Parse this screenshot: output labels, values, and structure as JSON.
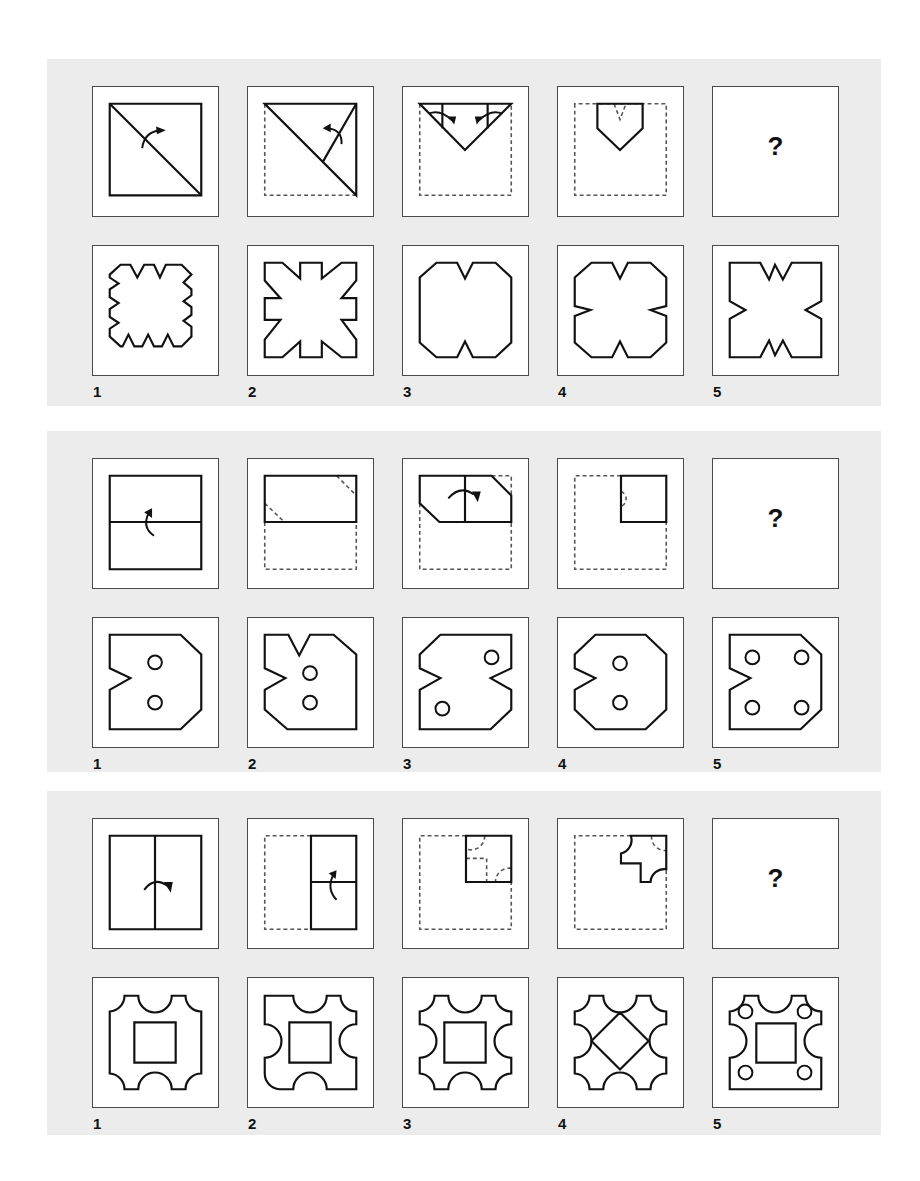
{
  "question_mark": "?",
  "colors": {
    "panel_bg": "#ececec",
    "stroke": "#111111",
    "dash": "#555555",
    "border": "#4a4a4a"
  },
  "puzzles": [
    {
      "top": 59,
      "height": 347,
      "steps": [
        {
          "solid": [
            "M17 17 H110 V110 H17 Z",
            "M17 17 L110 110"
          ],
          "dashed": [],
          "arrows": [
            "M50 62 Q52 46 68 44"
          ],
          "arrowheads": [
            [
              74,
              44,
              64,
              40,
              65,
              48
            ]
          ]
        },
        {
          "solid": [
            "M17 17 H110 V110 Z",
            "M76 76 L110 17 M17 17"
          ],
          "dashed": [
            "M17 17 V110 H110"
          ],
          "arrows": [
            "M95 58 Q96 44 82 42"
          ],
          "arrowheads": [
            [
              76,
              42,
              84,
              37,
              84,
              46
            ]
          ]
        },
        {
          "solid": [
            "M17 17 H110 L63 64 Z",
            "M40 17 V42",
            "M86 17 V42"
          ],
          "dashed": [
            "M17 17 V110 H110 V17"
          ],
          "arrows": [
            "M26 27 Q38 22 50 34",
            "M101 27 Q89 22 77 34"
          ],
          "arrowheads": [
            [
              52,
              38,
              46,
              30,
              54,
              30
            ],
            [
              75,
              38,
              73,
              30,
              81,
              30
            ]
          ]
        },
        {
          "solid": [
            "M40 17 H86 V42 L63 64 L40 42 Z"
          ],
          "dashed": [
            "M17 17 V110 H110 V17 Z",
            "M57 17 L63 33 L69 17"
          ],
          "arrows": [],
          "arrowheads": []
        },
        {
          "question": true
        }
      ],
      "options": [
        {
          "label": "1",
          "solid": [
            "M28 19 L38 19 L45 32 L52 19 L62 19 L68 32 L74 19 L82 19 L90 19 L100 29 L92 37 L100 44 L100 50 L92 56 L100 62 L100 70 L92 76 L100 82 L100 92 L90 102 L82 102 L76 90 L70 102 L62 102 L56 90 L50 102 L42 102 L36 90 L30 102 L28 102 L17 92 L17 84 L26 78 L17 72 L17 64 L26 58 L17 52 L17 44 L26 38 L17 32 L17 29 Z"
          ]
        },
        {
          "label": "2",
          "solid": [
            "M17 17 L35 17 L53 33 L53 17 L75 17 L75 33 L95 17 L110 17 L110 35 L95 53 L110 53 L110 75 L95 75 L110 95 L110 113 L95 113 L75 97 L75 113 L53 113 L53 97 L35 113 L17 113 L17 95 L33 75 L17 75 L17 53 L33 53 L17 35 Z"
          ]
        },
        {
          "label": "3",
          "solid": [
            "M34 17 L55 17 L63 33 L71 17 L94 17 L110 32 L110 98 L94 113 L71 113 L63 97 L55 113 L34 113 L17 98 L17 32 Z"
          ]
        },
        {
          "label": "4",
          "solid": [
            "M34 17 L55 17 L63 33 L71 17 L94 17 L110 32 L110 61 L94 65 L110 71 L110 98 L94 113 L71 113 L63 97 L55 113 L34 113 L17 98 L17 71 L33 65 L17 61 L17 32 Z"
          ]
        },
        {
          "label": "5",
          "solid": [
            "M17 17 L48 17 L57 34 L63 19 L71 34 L80 17 L110 17 L110 56 L94 65 L110 74 L110 113 L80 113 L71 96 L63 111 L57 96 L48 113 L17 113 L17 74 L33 65 L17 56 Z"
          ]
        }
      ]
    },
    {
      "top": 431,
      "height": 341,
      "steps": [
        {
          "solid": [
            "M17 17 H110 V112 H17 Z",
            "M17 64 H110"
          ],
          "dashed": [],
          "arrows": [
            "M62 78 Q50 70 56 56"
          ],
          "arrowheads": [
            [
              60,
              50,
              52,
              54,
              60,
              60
            ]
          ]
        },
        {
          "solid": [
            "M17 17 H110 V64 H17 Z"
          ],
          "dashed": [
            "M17 64 V112 H110 V64",
            "M90 17 L110 37",
            "M17 45 L37 64"
          ],
          "arrows": [],
          "arrowheads": []
        },
        {
          "solid": [
            "M17 17 H90 L110 37 V64 H37 L17 45 Z",
            "M63 17 V64"
          ],
          "dashed": [
            "M90 17 H110 V37",
            "M17 45 V112 H110 V64"
          ],
          "arrows": [
            "M46 40 Q58 26 72 36"
          ],
          "arrowheads": [
            [
              76,
              44,
              70,
              33,
              79,
              33
            ]
          ]
        },
        {
          "solid": [
            "M64 17 H110 V64 H64 Z"
          ],
          "dashed": [
            "M64 17 H17 V112 H110 V64",
            "M64 33 A8 8 0 0 1 64 48"
          ],
          "arrows": [],
          "arrowheads": []
        },
        {
          "question": true
        }
      ],
      "options": [
        {
          "label": "1",
          "solid": [
            "M17 17 L89 17 L110 37 L110 93 L89 113 L17 113 L17 73 L38 61 L17 51 Z"
          ],
          "circles": [
            [
              63,
              45,
              7
            ],
            [
              63,
              86,
              7
            ]
          ]
        },
        {
          "label": "2",
          "solid": [
            "M17 17 L41 17 L52 38 L63 17 L87 17 L110 37 L110 113 L40 113 L17 93 L17 73 L38 61 L17 51 Z"
          ],
          "circles": [
            [
              63,
              56,
              7
            ],
            [
              63,
              86,
              7
            ]
          ]
        },
        {
          "label": "3",
          "solid": [
            "M38 17 L110 17 L110 51 L89 61 L110 73 L110 93 L89 113 L17 113 L17 73 L38 61 L17 51 L17 37 Z"
          ],
          "circles": [
            [
              90,
              40,
              7
            ],
            [
              40,
              92,
              7
            ]
          ]
        },
        {
          "label": "4",
          "solid": [
            "M38 17 L89 17 L110 37 L110 93 L89 113 L38 113 L17 93 L17 73 L38 61 L17 51 L17 37 Z"
          ],
          "circles": [
            [
              63,
              46,
              7
            ],
            [
              63,
              86,
              7
            ]
          ]
        },
        {
          "label": "5",
          "solid": [
            "M17 17 L89 17 L110 37 L110 93 L89 113 L17 113 L17 73 L38 61 L17 51 Z"
          ],
          "circles": [
            [
              40,
              40,
              7
            ],
            [
              90,
              40,
              7
            ],
            [
              40,
              91,
              7
            ],
            [
              90,
              91,
              7
            ]
          ]
        }
      ]
    },
    {
      "top": 791,
      "height": 344,
      "steps": [
        {
          "solid": [
            "M17 17 H110 V112 H17 Z",
            "M63 17 V112"
          ],
          "dashed": [],
          "arrows": [
            "M52 72 Q62 58 76 68"
          ],
          "arrowheads": [
            [
              79,
              75,
              72,
              64,
              81,
              64
            ]
          ]
        },
        {
          "solid": [
            "M64 17 H110 V112 H64 Z",
            "M64 64 H110"
          ],
          "dashed": [
            "M64 17 H17 V112 H64"
          ],
          "arrows": [
            "M90 82 Q80 72 86 58"
          ],
          "arrowheads": [
            [
              90,
              52,
              82,
              55,
              89,
              61
            ]
          ]
        },
        {
          "solid": [
            "M64 17 H110 V64 H64 Z"
          ],
          "dashed": [
            "M64 17 H17 V112 H110 V64",
            "M64 40 H85 V64",
            "M83 17 A14 14 0 0 1 66 31",
            "M110 50 A14 14 0 0 0 94 64"
          ],
          "arrows": [],
          "arrowheads": []
        },
        {
          "solid": [
            "M74 17 H110 V51 A14 14 0 0 0 94 64 H84 V45 H64 V35 A14 14 0 0 0 74 17 Z"
          ],
          "dashed": [
            "M74 17 H17 V112 H110 V51",
            "M95 17 A14 14 0 0 0 110 32"
          ],
          "arrows": [],
          "arrowheads": []
        },
        {
          "question": true
        }
      ],
      "options": [
        {
          "label": "1",
          "solid": [
            "M32 18 L46 18 A17 17 0 0 0 80 18 L94 18 A16 16 0 0 0 110 34 L110 97 A16 16 0 0 0 94 113 L80 113 A17 17 0 0 0 46 113 L32 113 A16 16 0 0 0 17 97 L17 34 A16 16 0 0 0 32 18 Z",
            "M42 45 H84 V86 H42 Z"
          ]
        },
        {
          "label": "2",
          "solid": [
            "M17 18 L46 18 A17 17 0 0 0 80 18 L94 18 A16 16 0 0 0 110 34 L110 47 A17 17 0 0 0 110 81 L110 113 L80 113 A17 17 0 0 0 46 113 L32 113 A16 16 0 0 1 17 97 L17 81 A17 17 0 0 0 17 47 Z",
            "M42 45 H84 V86 H42 Z"
          ]
        },
        {
          "label": "3",
          "solid": [
            "M32 18 L46 18 A17 17 0 0 0 80 18 L94 18 A16 16 0 0 0 110 34 L110 47 A17 17 0 0 0 110 81 L110 97 A16 16 0 0 0 94 113 L80 113 A17 17 0 0 0 46 113 L32 113 A16 16 0 0 0 17 97 L17 81 A17 17 0 0 0 17 47 L17 34 A16 16 0 0 0 32 18 Z",
            "M42 45 H84 V86 H42 Z"
          ]
        },
        {
          "label": "4",
          "solid": [
            "M32 18 L46 18 A17 17 0 0 0 80 18 L94 18 A16 16 0 0 0 110 34 L110 47 A17 17 0 0 0 110 81 L110 97 A16 16 0 0 0 94 113 L80 113 A17 17 0 0 0 46 113 L32 113 A16 16 0 0 0 17 97 L17 81 A17 17 0 0 0 17 47 L17 34 A16 16 0 0 0 32 18 Z",
            "M63 35 L92 64 L63 93 L34 64 Z"
          ]
        },
        {
          "label": "5",
          "solid": [
            "M32 18 L46 18 A17 17 0 0 0 80 18 L94 18 A16 16 0 0 0 110 34 L110 47 A17 17 0 0 0 110 81 L110 113 L17 113 L17 81 A17 17 0 0 0 17 47 L17 34 A16 16 0 0 0 32 18 Z",
            "M44 46 H84 V86 H44 Z"
          ],
          "circles": [
            [
              33,
              34,
              7
            ],
            [
              93,
              34,
              7
            ],
            [
              33,
              96,
              7
            ],
            [
              93,
              96,
              7
            ]
          ]
        }
      ]
    }
  ]
}
